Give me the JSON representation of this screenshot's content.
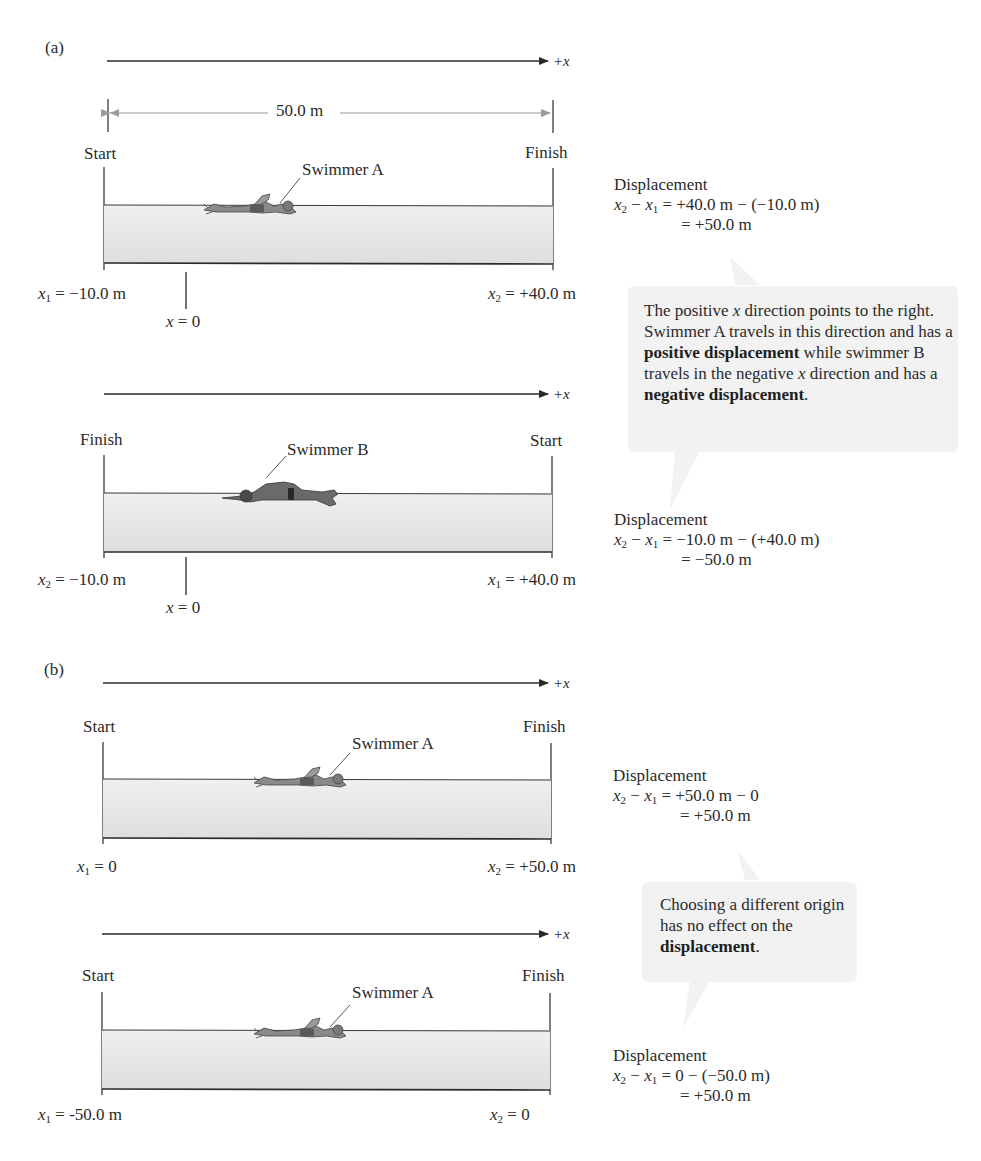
{
  "panels": {
    "a": {
      "label": "(a)",
      "axis_label": "+x",
      "distance_label": "50.0 m",
      "pools": [
        {
          "id": "a1",
          "left_label": "Start",
          "right_label": "Finish",
          "swimmer_label": "Swimmer A",
          "swimmer_direction": "right",
          "left_pos": {
            "var": "x",
            "sub": "1",
            "value": " = −10.0 m"
          },
          "right_pos": {
            "var": "x",
            "sub": "2",
            "value": " = +40.0 m"
          },
          "origin_label": {
            "var": "x",
            "value": " = 0"
          },
          "displacement": {
            "title": "Displacement",
            "line1_vars": [
              "x",
              "2",
              " − ",
              "x",
              "1"
            ],
            "line1_rhs": " = +40.0 m − (−10.0 m)",
            "line2": "= +50.0 m"
          }
        },
        {
          "id": "a2",
          "axis_label": "+x",
          "left_label": "Finish",
          "right_label": "Start",
          "swimmer_label": "Swimmer B",
          "swimmer_direction": "left",
          "left_pos": {
            "var": "x",
            "sub": "2",
            "value": " = −10.0 m"
          },
          "right_pos": {
            "var": "x",
            "sub": "1",
            "value": " = +40.0 m"
          },
          "origin_label": {
            "var": "x",
            "value": " = 0"
          },
          "displacement": {
            "title": "Displacement",
            "line1_rhs": " = −10.0 m − (+40.0 m)",
            "line2": "= −50.0 m"
          }
        }
      ],
      "callout": {
        "pre1": "The positive ",
        "var1": "x",
        "post1": " direction points to the right. Swimmer A travels in this direction and has a ",
        "bold1": "positive displacement",
        "mid": " while swimmer B travels in the negative ",
        "var2": "x",
        "post2": " direction and has a ",
        "bold2": "negative displacement",
        "end": "."
      }
    },
    "b": {
      "label": "(b)",
      "axis_label": "+x",
      "pools": [
        {
          "id": "b1",
          "left_label": "Start",
          "right_label": "Finish",
          "swimmer_label": "Swimmer A",
          "swimmer_direction": "right",
          "left_pos": {
            "var": "x",
            "sub": "1",
            "value": " = 0"
          },
          "right_pos": {
            "var": "x",
            "sub": "2",
            "value": " = +50.0 m"
          },
          "displacement": {
            "title": "Displacement",
            "line1_rhs": " = +50.0 m − 0",
            "line2": "= +50.0 m"
          }
        },
        {
          "id": "b2",
          "axis_label": "+x",
          "left_label": "Start",
          "right_label": "Finish",
          "swimmer_label": "Swimmer A",
          "swimmer_direction": "right",
          "left_pos": {
            "var": "x",
            "sub": "1",
            "value": " = -50.0 m"
          },
          "right_pos": {
            "var": "x",
            "sub": "2",
            "value": " = 0"
          },
          "displacement": {
            "title": "Displacement",
            "line1_rhs": " = 0 − (−50.0 m)",
            "line2": "= +50.0 m"
          }
        }
      ],
      "callout": {
        "pre": "Choosing a different origin has no effect on the ",
        "bold": "displacement",
        "end": "."
      }
    }
  },
  "common": {
    "var_x": "x",
    "sub1": "1",
    "sub2": "2",
    "minus": " − "
  },
  "colors": {
    "pool_fill": "#e9e9e9",
    "pool_line": "#3a3a3a",
    "callout_bg": "#f2f2f2",
    "dim_arrow": "#9a9a9a",
    "swimmer": "#6e6e6e"
  }
}
